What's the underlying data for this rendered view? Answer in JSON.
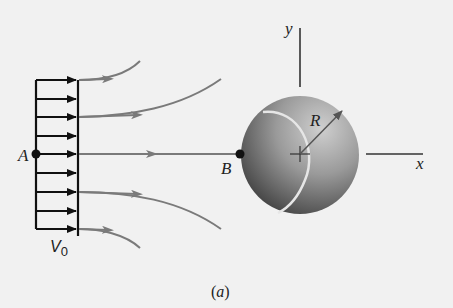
{
  "figure": {
    "caption_open": "(",
    "caption_letter": "a",
    "caption_close": ")",
    "labels": {
      "point_a": "A",
      "point_b": "B",
      "radius": "R",
      "x_axis": "x",
      "y_axis": "y",
      "velocity": "V",
      "velocity_subscript": "0"
    },
    "colors": {
      "background": "#f1f1f1",
      "profile": "#111111",
      "streamline": "#7a7a7a",
      "sphere_light": "#bdbdbd",
      "sphere_dark": "#3e3e3e",
      "seam": "#e8e8e8"
    },
    "velocity_profile": {
      "arrow_count": 9,
      "description": "uniform upstream velocity profile"
    },
    "streamlines_count": 5
  }
}
